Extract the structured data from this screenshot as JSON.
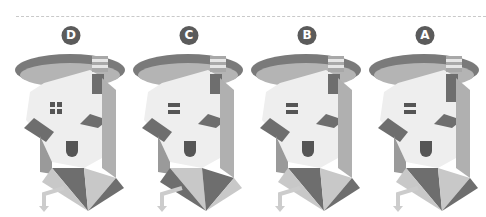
{
  "puzzle": {
    "figures": [
      {
        "label": "D",
        "window": "four-pane",
        "x": 12
      },
      {
        "label": "C",
        "window": "two-bar",
        "x": 130
      },
      {
        "label": "B",
        "window": "two-bar",
        "x": 248
      },
      {
        "label": "A",
        "window": "two-bar",
        "x": 366
      }
    ]
  },
  "colors": {
    "badge": "#5b5b5b",
    "disc_dark": "#7a7a7a",
    "disc_light": "#b4b4b4",
    "wall": "#eeeeee",
    "shade_dark": "#6e6e6e",
    "shade_mid": "#9a9a9a",
    "shade_light": "#c8c8c8",
    "dash": "#c9c9c9"
  }
}
